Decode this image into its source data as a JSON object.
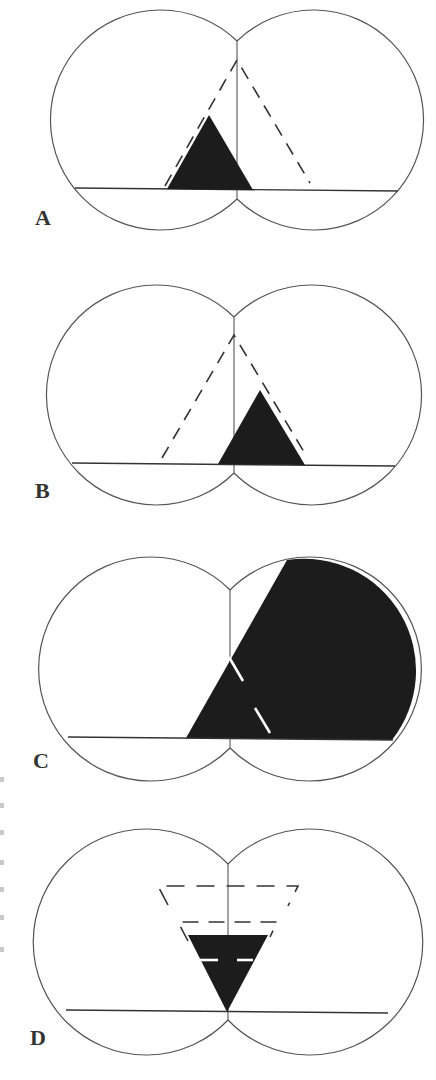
{
  "figure": {
    "panels": [
      {
        "id": "A",
        "label": "A",
        "description": "Two overlapping circles with baseline and vertical midline; dashed triangle apex at midline; filled triangle shifted left"
      },
      {
        "id": "B",
        "label": "B",
        "description": "Mirror of A: filled triangle shifted right"
      },
      {
        "id": "C",
        "label": "C",
        "description": "Large filled region covering most of right circle bounded by a diagonal line; white dashed segments inside"
      },
      {
        "id": "D",
        "label": "D",
        "description": "Inverted triangles: two dashed trapezoid outlines and a filled inverted triangle with apex on baseline"
      }
    ],
    "colors": {
      "outline": "#555555",
      "fill": "#1c1c1c",
      "background": "#ffffff"
    }
  }
}
